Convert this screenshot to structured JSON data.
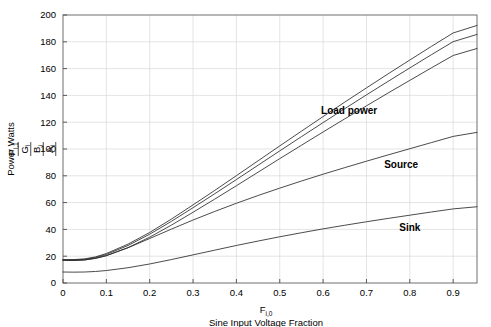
{
  "chart_data": {
    "type": "line",
    "title": "",
    "xlabel_symbol": "F",
    "xlabel_symbol_sub": "i,0",
    "xlabel": "Sine Input Voltage Fraction",
    "ylabel": "Power Watts",
    "y_legend_symbols": [
      {
        "base": "A",
        "sub": "i"
      },
      {
        "base": "B",
        "sub": "i"
      },
      {
        "base": "G",
        "sub": "i"
      },
      {
        "base": "P",
        "sub": "i,1"
      }
    ],
    "xlim": [
      0,
      0.955
    ],
    "ylim": [
      0,
      200
    ],
    "xticks": [
      0,
      0.1,
      0.2,
      0.3,
      0.4,
      0.5,
      0.6,
      0.7,
      0.8,
      0.9
    ],
    "xticklabels": [
      "0",
      "0.1",
      "0.2",
      "0.3",
      "0.4",
      "0.5",
      "0.6",
      "0.7",
      "0.8",
      "0.9"
    ],
    "yticks": [
      0,
      20,
      40,
      60,
      80,
      100,
      120,
      140,
      160,
      180,
      200
    ],
    "yticklabels": [
      "0",
      "20",
      "40",
      "60",
      "80",
      "100",
      "120",
      "140",
      "160",
      "180",
      "200"
    ],
    "grid": true,
    "grid_color": "#d8d8d8",
    "line_color": "#2b2b2b",
    "legend_position": "inline-annotations",
    "annotations": [
      {
        "text": "Load power",
        "x": 0.66,
        "y": 126
      },
      {
        "text": "Source",
        "x": 0.78,
        "y": 86
      },
      {
        "text": "Sink",
        "x": 0.8,
        "y": 39
      }
    ],
    "x": [
      0,
      0.025,
      0.05,
      0.075,
      0.1,
      0.15,
      0.2,
      0.25,
      0.3,
      0.35,
      0.4,
      0.45,
      0.5,
      0.55,
      0.6,
      0.65,
      0.7,
      0.75,
      0.8,
      0.85,
      0.9,
      0.955
    ],
    "series": [
      {
        "name": "A_i",
        "group": "Load power",
        "values": [
          17.0,
          16.9,
          17.2,
          18.4,
          20.4,
          26.4,
          34.2,
          43.2,
          52.8,
          62.6,
          72.6,
          82.7,
          92.8,
          102.8,
          112.7,
          122.5,
          132.2,
          141.8,
          151.2,
          160.6,
          169.8,
          175.0
        ]
      },
      {
        "name": "B_i",
        "group": "Load power",
        "values": [
          17.2,
          17.2,
          17.6,
          19.0,
          21.3,
          28.0,
          36.4,
          46.0,
          56.2,
          66.6,
          77.2,
          87.9,
          98.6,
          109.2,
          119.7,
          130.1,
          140.4,
          150.5,
          160.5,
          170.4,
          180.1,
          185.5
        ]
      },
      {
        "name": "G_i",
        "group": "Load power",
        "values": [
          17.4,
          17.5,
          18.0,
          19.5,
          22.0,
          29.0,
          37.7,
          47.7,
          58.3,
          69.1,
          80.1,
          91.2,
          102.3,
          113.3,
          124.2,
          135.0,
          145.6,
          156.1,
          166.4,
          176.6,
          186.6,
          192.2
        ]
      },
      {
        "name": "Source",
        "group": "Source",
        "values": [
          17.0,
          16.9,
          17.2,
          18.4,
          20.4,
          26.3,
          33.2,
          40.2,
          47.0,
          53.4,
          59.5,
          65.3,
          70.8,
          76.1,
          81.2,
          86.1,
          90.9,
          95.6,
          100.2,
          104.8,
          109.4,
          112.4
        ]
      },
      {
        "name": "P_i,1",
        "group": "Sink",
        "values": [
          8.2,
          8.1,
          8.2,
          8.6,
          9.3,
          11.4,
          14.2,
          17.5,
          21.0,
          24.5,
          28.0,
          31.3,
          34.5,
          37.5,
          40.4,
          43.1,
          45.7,
          48.2,
          50.6,
          53.0,
          55.3,
          56.9
        ]
      }
    ]
  }
}
